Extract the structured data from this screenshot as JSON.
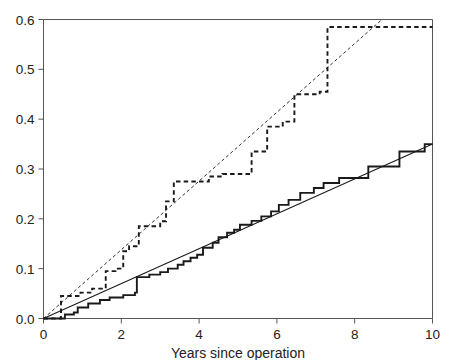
{
  "chart_data": {
    "type": "line",
    "title": "",
    "subtitle": "",
    "xlabel": "Years since operation",
    "ylabel": "",
    "xlim": [
      0,
      10
    ],
    "ylim": [
      0.0,
      0.6
    ],
    "grid": false,
    "legend": "none",
    "x_ticks": [
      0,
      2,
      4,
      6,
      8,
      10
    ],
    "x_tick_labels": [
      "0",
      "2",
      "4",
      "6",
      "8",
      "10"
    ],
    "y_ticks": [
      0.0,
      0.1,
      0.2,
      0.3,
      0.4,
      0.5,
      0.6
    ],
    "y_tick_labels": [
      "0.0",
      "0.1",
      "0.2",
      "0.3",
      "0.4",
      "0.5",
      "0.6"
    ],
    "annotations": [],
    "series": [
      {
        "name": "upper-step-curve",
        "style": "dashed-step",
        "color": "#1a1a1a",
        "points": [
          [
            0.0,
            0.0
          ],
          [
            0.45,
            0.0
          ],
          [
            0.45,
            0.045
          ],
          [
            0.95,
            0.045
          ],
          [
            0.95,
            0.052
          ],
          [
            1.25,
            0.052
          ],
          [
            1.25,
            0.06
          ],
          [
            1.6,
            0.06
          ],
          [
            1.6,
            0.095
          ],
          [
            1.85,
            0.095
          ],
          [
            1.85,
            0.1
          ],
          [
            2.05,
            0.1
          ],
          [
            2.05,
            0.135
          ],
          [
            2.2,
            0.135
          ],
          [
            2.2,
            0.145
          ],
          [
            2.45,
            0.145
          ],
          [
            2.45,
            0.185
          ],
          [
            3.0,
            0.185
          ],
          [
            3.0,
            0.195
          ],
          [
            3.15,
            0.195
          ],
          [
            3.15,
            0.235
          ],
          [
            3.35,
            0.235
          ],
          [
            3.35,
            0.275
          ],
          [
            4.25,
            0.275
          ],
          [
            4.25,
            0.285
          ],
          [
            4.6,
            0.285
          ],
          [
            4.6,
            0.29
          ],
          [
            5.35,
            0.29
          ],
          [
            5.35,
            0.335
          ],
          [
            5.75,
            0.335
          ],
          [
            5.75,
            0.385
          ],
          [
            6.15,
            0.385
          ],
          [
            6.15,
            0.395
          ],
          [
            6.45,
            0.395
          ],
          [
            6.45,
            0.45
          ],
          [
            7.1,
            0.45
          ],
          [
            7.1,
            0.455
          ],
          [
            7.3,
            0.455
          ],
          [
            7.3,
            0.585
          ],
          [
            10.0,
            0.585
          ]
        ]
      },
      {
        "name": "upper-reference-line",
        "style": "dashed-straight",
        "color": "#1a1a1a",
        "points": [
          [
            0.0,
            0.0
          ],
          [
            8.7,
            0.6
          ]
        ]
      },
      {
        "name": "lower-step-curve",
        "style": "solid-step",
        "color": "#1a1a1a",
        "points": [
          [
            0.0,
            0.0
          ],
          [
            0.55,
            0.0
          ],
          [
            0.55,
            0.008
          ],
          [
            0.78,
            0.008
          ],
          [
            0.78,
            0.012
          ],
          [
            0.88,
            0.012
          ],
          [
            0.88,
            0.022
          ],
          [
            1.15,
            0.022
          ],
          [
            1.15,
            0.03
          ],
          [
            1.45,
            0.03
          ],
          [
            1.45,
            0.037
          ],
          [
            1.7,
            0.037
          ],
          [
            1.7,
            0.042
          ],
          [
            2.05,
            0.042
          ],
          [
            2.05,
            0.047
          ],
          [
            2.35,
            0.047
          ],
          [
            2.35,
            0.052
          ],
          [
            2.4,
            0.052
          ],
          [
            2.4,
            0.083
          ],
          [
            2.72,
            0.083
          ],
          [
            2.72,
            0.088
          ],
          [
            3.0,
            0.088
          ],
          [
            3.0,
            0.093
          ],
          [
            3.2,
            0.093
          ],
          [
            3.2,
            0.1
          ],
          [
            3.45,
            0.1
          ],
          [
            3.45,
            0.108
          ],
          [
            3.6,
            0.108
          ],
          [
            3.6,
            0.115
          ],
          [
            3.78,
            0.115
          ],
          [
            3.78,
            0.122
          ],
          [
            3.95,
            0.122
          ],
          [
            3.95,
            0.128
          ],
          [
            4.1,
            0.128
          ],
          [
            4.1,
            0.142
          ],
          [
            4.35,
            0.142
          ],
          [
            4.35,
            0.152
          ],
          [
            4.5,
            0.152
          ],
          [
            4.5,
            0.163
          ],
          [
            4.72,
            0.163
          ],
          [
            4.72,
            0.172
          ],
          [
            4.9,
            0.172
          ],
          [
            4.9,
            0.178
          ],
          [
            5.05,
            0.178
          ],
          [
            5.05,
            0.188
          ],
          [
            5.35,
            0.188
          ],
          [
            5.35,
            0.196
          ],
          [
            5.6,
            0.196
          ],
          [
            5.6,
            0.205
          ],
          [
            5.85,
            0.205
          ],
          [
            5.85,
            0.215
          ],
          [
            6.05,
            0.215
          ],
          [
            6.05,
            0.228
          ],
          [
            6.3,
            0.228
          ],
          [
            6.3,
            0.238
          ],
          [
            6.6,
            0.238
          ],
          [
            6.6,
            0.252
          ],
          [
            6.95,
            0.252
          ],
          [
            6.95,
            0.262
          ],
          [
            7.2,
            0.262
          ],
          [
            7.2,
            0.272
          ],
          [
            7.6,
            0.272
          ],
          [
            7.6,
            0.282
          ],
          [
            8.35,
            0.282
          ],
          [
            8.35,
            0.305
          ],
          [
            9.15,
            0.305
          ],
          [
            9.15,
            0.335
          ],
          [
            9.8,
            0.335
          ],
          [
            9.8,
            0.35
          ],
          [
            10.0,
            0.35
          ]
        ]
      },
      {
        "name": "lower-reference-line",
        "style": "solid-straight",
        "color": "#1a1a1a",
        "points": [
          [
            0.0,
            0.0
          ],
          [
            10.0,
            0.35
          ]
        ]
      }
    ]
  },
  "axes": {
    "frame_color": "#555555",
    "line_color": "#1a1a1a"
  }
}
